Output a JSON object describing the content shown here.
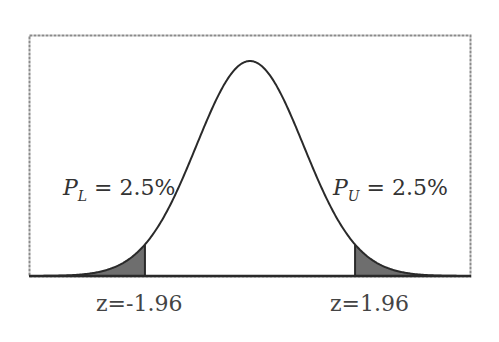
{
  "chart_data": {
    "type": "area",
    "title": "",
    "distribution": {
      "name": "standard normal",
      "mean": 0,
      "sd": 1
    },
    "xlabel": "",
    "ylabel": "",
    "grid": false,
    "frame": "dashed box",
    "shaded_regions": [
      {
        "name": "lower tail",
        "from": "-inf",
        "to": -1.96,
        "probability_percent": 2.5
      },
      {
        "name": "upper tail",
        "from": 1.96,
        "to": "inf",
        "probability_percent": 2.5
      }
    ],
    "annotations": [
      {
        "text": "P_L = 2.5%",
        "position": "left of curve"
      },
      {
        "text": "P_U = 2.5%",
        "position": "right of curve"
      },
      {
        "text": "z=-1.96",
        "position": "below lower cutoff"
      },
      {
        "text": "z=1.96",
        "position": "below upper cutoff"
      }
    ]
  },
  "labels": {
    "lower": {
      "symbol": "P",
      "subscript": "L",
      "rest": " = 2.5%"
    },
    "upper": {
      "symbol": "P",
      "subscript": "U",
      "rest": " = 2.5%"
    },
    "z_lower": "z=-1.96",
    "z_upper": "z=1.96"
  },
  "colors": {
    "curve": "#2a2a2a",
    "shade": "#6e6e6e",
    "frame": "#8a8a8a"
  }
}
